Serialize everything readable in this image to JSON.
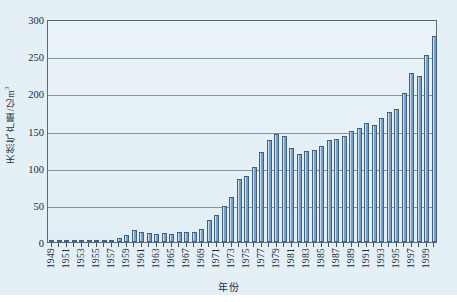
{
  "chart_data": {
    "type": "bar",
    "title": "",
    "xlabel": "年份",
    "ylabel": "天然气产量/亿m³",
    "ylabel_text": "天然气产量/亿m",
    "ylabel_superscript": "3",
    "ylim": [
      0,
      300
    ],
    "yticks": [
      0,
      50,
      100,
      150,
      200,
      250,
      300
    ],
    "ytick_labels": [
      "0",
      "50",
      "100",
      "150",
      "200",
      "250",
      "300"
    ],
    "grid": true,
    "grid_axis": "y",
    "legend": "none",
    "bar_color": "#7ba8cf",
    "bar_edge_color": "#45617a",
    "plot_background": "#e4eff6",
    "categories": [
      "1949",
      "1950",
      "1951",
      "1952",
      "1953",
      "1954",
      "1955",
      "1956",
      "1957",
      "1958",
      "1959",
      "1960",
      "1961",
      "1962",
      "1963",
      "1964",
      "1965",
      "1966",
      "1967",
      "1968",
      "1969",
      "1970",
      "1971",
      "1972",
      "1973",
      "1974",
      "1975",
      "1976",
      "1977",
      "1978",
      "1979",
      "1980",
      "1981",
      "1982",
      "1983",
      "1984",
      "1985",
      "1986",
      "1987",
      "1988",
      "1989",
      "1990",
      "1991",
      "1992",
      "1993",
      "1994",
      "1995",
      "1996",
      "1997",
      "1998",
      "1999",
      "2000"
    ],
    "xtick_labels": [
      "1949",
      "1951",
      "1953",
      "1955",
      "1957",
      "1959",
      "1961",
      "1963",
      "1965",
      "1967",
      "1969",
      "1971",
      "1973",
      "1975",
      "1977",
      "1979",
      "1981",
      "1983",
      "1985",
      "1987",
      "1989",
      "1991",
      "1993",
      "1995",
      "1997",
      "1999"
    ],
    "values": [
      1,
      1,
      1,
      1,
      1,
      1,
      1,
      2,
      3,
      5,
      10,
      16,
      13,
      12,
      11,
      12,
      11,
      14,
      14,
      14,
      17,
      29,
      36,
      48,
      60,
      85,
      89,
      101,
      121,
      137,
      145,
      143,
      127,
      119,
      122,
      124,
      129,
      137,
      139,
      143,
      150,
      153,
      160,
      158,
      167,
      175,
      179,
      201,
      227,
      223,
      252,
      277
    ],
    "annotations": []
  }
}
